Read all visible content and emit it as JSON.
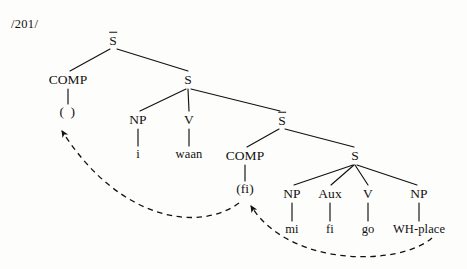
{
  "figure": {
    "page_number": "/201/",
    "caption": "",
    "line_color": "#111111",
    "text_color": "#111111",
    "background_color": "#fdfdfb"
  },
  "tree": {
    "nodes": [
      {
        "id": "sbar-top",
        "label": "S",
        "overline": true,
        "kind": "category",
        "x": 113,
        "y": 40
      },
      {
        "id": "comp-top",
        "label": "COMP",
        "overline": false,
        "kind": "category",
        "x": 68,
        "y": 80
      },
      {
        "id": "comp-top-t",
        "label": "(  )",
        "overline": false,
        "kind": "trace",
        "x": 68,
        "y": 112
      },
      {
        "id": "s-main",
        "label": "S",
        "overline": false,
        "kind": "category",
        "x": 188,
        "y": 80
      },
      {
        "id": "np-subj",
        "label": "NP",
        "overline": false,
        "kind": "category",
        "x": 138,
        "y": 120
      },
      {
        "id": "np-subj-t",
        "label": "i",
        "overline": false,
        "kind": "terminal",
        "x": 138,
        "y": 154
      },
      {
        "id": "v-main",
        "label": "V",
        "overline": false,
        "kind": "category",
        "x": 189,
        "y": 120
      },
      {
        "id": "v-main-t",
        "label": "waan",
        "overline": false,
        "kind": "terminal",
        "x": 189,
        "y": 154
      },
      {
        "id": "sbar-emb",
        "label": "S",
        "overline": true,
        "kind": "category",
        "x": 282,
        "y": 120
      },
      {
        "id": "comp-emb",
        "label": "COMP",
        "overline": false,
        "kind": "category",
        "x": 245,
        "y": 156
      },
      {
        "id": "comp-emb-t",
        "label": "(fi)",
        "overline": false,
        "kind": "trace",
        "x": 245,
        "y": 189
      },
      {
        "id": "s-emb",
        "label": "S",
        "overline": false,
        "kind": "category",
        "x": 355,
        "y": 156
      },
      {
        "id": "np-emb",
        "label": "NP",
        "overline": false,
        "kind": "category",
        "x": 292,
        "y": 194
      },
      {
        "id": "np-emb-t",
        "label": "mi",
        "overline": false,
        "kind": "terminal",
        "x": 292,
        "y": 229
      },
      {
        "id": "aux-emb",
        "label": "Aux",
        "overline": false,
        "kind": "category",
        "x": 330,
        "y": 194
      },
      {
        "id": "aux-emb-t",
        "label": "fi",
        "overline": false,
        "kind": "terminal",
        "x": 330,
        "y": 229
      },
      {
        "id": "v-emb",
        "label": "V",
        "overline": false,
        "kind": "category",
        "x": 368,
        "y": 194
      },
      {
        "id": "v-emb-t",
        "label": "go",
        "overline": false,
        "kind": "terminal",
        "x": 368,
        "y": 229
      },
      {
        "id": "np-wh",
        "label": "NP",
        "overline": false,
        "kind": "category",
        "x": 419,
        "y": 194
      },
      {
        "id": "np-wh-t",
        "label": "WH-place",
        "overline": false,
        "kind": "terminal",
        "x": 419,
        "y": 229
      }
    ],
    "branches": [
      {
        "from": "sbar-top",
        "to": "comp-top",
        "x1": 110,
        "y1": 49,
        "x2": 70,
        "y2": 71
      },
      {
        "from": "sbar-top",
        "to": "s-main",
        "x1": 117,
        "y1": 49,
        "x2": 188,
        "y2": 71
      },
      {
        "from": "comp-top",
        "to": "comp-top-t",
        "x1": 68,
        "y1": 89,
        "x2": 68,
        "y2": 104
      },
      {
        "from": "s-main",
        "to": "np-subj",
        "x1": 186,
        "y1": 89,
        "x2": 140,
        "y2": 111
      },
      {
        "from": "s-main",
        "to": "v-main",
        "x1": 188,
        "y1": 89,
        "x2": 189,
        "y2": 111
      },
      {
        "from": "s-main",
        "to": "sbar-emb",
        "x1": 191,
        "y1": 89,
        "x2": 280,
        "y2": 111
      },
      {
        "from": "np-subj",
        "to": "np-subj-t",
        "x1": 138,
        "y1": 129,
        "x2": 138,
        "y2": 146
      },
      {
        "from": "v-main",
        "to": "v-main-t",
        "x1": 189,
        "y1": 129,
        "x2": 189,
        "y2": 146
      },
      {
        "from": "sbar-emb",
        "to": "comp-emb",
        "x1": 279,
        "y1": 129,
        "x2": 247,
        "y2": 147
      },
      {
        "from": "sbar-emb",
        "to": "s-emb",
        "x1": 285,
        "y1": 129,
        "x2": 354,
        "y2": 147
      },
      {
        "from": "comp-emb",
        "to": "comp-emb-t",
        "x1": 245,
        "y1": 165,
        "x2": 245,
        "y2": 181
      },
      {
        "from": "s-emb",
        "to": "np-emb",
        "x1": 353,
        "y1": 165,
        "x2": 294,
        "y2": 185
      },
      {
        "from": "s-emb",
        "to": "aux-emb",
        "x1": 354,
        "y1": 165,
        "x2": 331,
        "y2": 185
      },
      {
        "from": "s-emb",
        "to": "v-emb",
        "x1": 355,
        "y1": 165,
        "x2": 368,
        "y2": 185
      },
      {
        "from": "s-emb",
        "to": "np-wh",
        "x1": 357,
        "y1": 165,
        "x2": 417,
        "y2": 185
      },
      {
        "from": "np-emb",
        "to": "np-emb-t",
        "x1": 292,
        "y1": 203,
        "x2": 292,
        "y2": 221
      },
      {
        "from": "aux-emb",
        "to": "aux-emb-t",
        "x1": 330,
        "y1": 203,
        "x2": 330,
        "y2": 221
      },
      {
        "from": "v-emb",
        "to": "v-emb-t",
        "x1": 368,
        "y1": 203,
        "x2": 368,
        "y2": 221
      },
      {
        "from": "np-wh",
        "to": "np-wh-t",
        "x1": 419,
        "y1": 203,
        "x2": 419,
        "y2": 221
      }
    ],
    "movement_arrows": [
      {
        "id": "move-to-matrix-comp",
        "from": "comp-emb-t",
        "to": "comp-top-t",
        "path": "M 239 203 C 200 232, 120 222, 62 131",
        "label": ""
      },
      {
        "id": "move-to-embedded-comp",
        "from": "np-wh-t",
        "to": "comp-emb-t",
        "path": "M 432 238 C 400 266, 290 268, 251 206",
        "label": ""
      }
    ]
  }
}
